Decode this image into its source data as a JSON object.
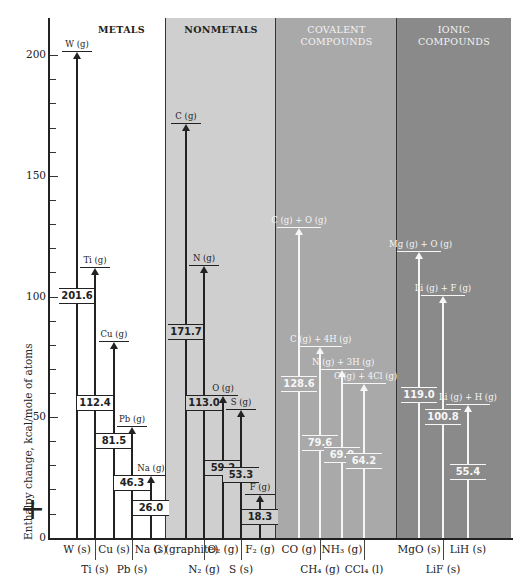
{
  "chart_data": {
    "type": "bar",
    "subtype": "enthalpy-level-diagram",
    "title": "",
    "ylabel": "Enthalpy change, kcal/mole of atoms",
    "ylim": [
      0,
      210
    ],
    "yticks": [
      0,
      50,
      100,
      150,
      200
    ],
    "annotation": "+",
    "groups": [
      {
        "name": "METALS",
        "items": [
          {
            "solid": "W (s)",
            "gas": "W (g)",
            "value": 201.6
          },
          {
            "solid": "Ti (s)",
            "gas": "Ti (g)",
            "value": 112.4
          },
          {
            "solid": "Cu (s)",
            "gas": "Cu (g)",
            "value": 81.5
          },
          {
            "solid": "Pb (s)",
            "gas": "Pb (g)",
            "value": 46.3
          },
          {
            "solid": "Na (s)",
            "gas": "Na (g)",
            "value": 26.0
          }
        ]
      },
      {
        "name": "NONMETALS",
        "items": [
          {
            "solid": "C (graphite)",
            "gas": "C (g)",
            "value": 171.7
          },
          {
            "solid": "N2 (g)",
            "gas": "N (g)",
            "value": 113.0
          },
          {
            "solid": "O2 (g)",
            "gas": "O (g)",
            "value": 59.2
          },
          {
            "solid": "S (s)",
            "gas": "S (g)",
            "value": 53.3
          },
          {
            "solid": "F2 (g)",
            "gas": "F (g)",
            "value": 18.3
          }
        ]
      },
      {
        "name": "COVALENT COMPOUNDS",
        "items": [
          {
            "solid": "CO (g)",
            "gas": "C (g) + O (g)",
            "value": 128.6
          },
          {
            "solid": "CH4 (g)",
            "gas": "C (g) + 4H (g)",
            "value": 79.6
          },
          {
            "solid": "NH3 (g)",
            "gas": "N (g) + 3H (g)",
            "value": 69.9
          },
          {
            "solid": "CCl4 (l)",
            "gas": "C (g) + 4Cl (g)",
            "value": 64.2
          }
        ]
      },
      {
        "name": "IONIC COMPOUNDS",
        "items": [
          {
            "solid": "MgO (s)",
            "gas": "Mg (g) + O (g)",
            "value": 119.0
          },
          {
            "solid": "LiF (s)",
            "gas": "Li (g) + F (g)",
            "value": 100.8
          },
          {
            "solid": "LiH (s)",
            "gas": "Li (g) + H (g)",
            "value": 55.4
          }
        ]
      }
    ],
    "categories": [
      "W (s)",
      "Ti (s)",
      "Cu (s)",
      "Pb (s)",
      "Na (s)",
      "C (graphite)",
      "N2 (g)",
      "O2 (g)",
      "S (s)",
      "F2 (g)",
      "CO (g)",
      "CH4 (g)",
      "NH3 (g)",
      "CCl4 (l)",
      "MgO (s)",
      "LiF (s)",
      "LiH (s)"
    ],
    "values": [
      201.6,
      112.4,
      81.5,
      46.3,
      26.0,
      171.7,
      113.0,
      59.2,
      53.3,
      18.3,
      128.6,
      79.6,
      69.9,
      64.2,
      119.0,
      100.8,
      55.4
    ],
    "grid": false,
    "legend": null
  },
  "panels": {
    "metals": {
      "title": "METALS",
      "color": "#ffffff"
    },
    "nonmetals": {
      "title": "NONMETALS",
      "color": "#cfcfcf"
    },
    "covalent": {
      "title_1": "COVALENT",
      "title_2": "COMPOUNDS",
      "color": "#a9a9a9"
    },
    "ionic": {
      "title_1": "IONIC",
      "title_2": "COMPOUNDS",
      "color": "#8a8a8a"
    }
  },
  "axis": {
    "ylabel": "Enthalpy change, kcal/mole of atoms",
    "ticks": [
      "0",
      "50",
      "100",
      "150",
      "200"
    ],
    "plus": "+"
  },
  "bars": [
    {
      "id": "w",
      "x": 77,
      "val": "201.6",
      "gas": "W (g)",
      "solid": "W (s)",
      "row": 1,
      "dark": true
    },
    {
      "id": "ti",
      "x": 95,
      "val": "112.4",
      "gas": "Ti (g)",
      "solid": "Ti (s)",
      "row": 2,
      "dark": true
    },
    {
      "id": "cu",
      "x": 114,
      "val": "81.5",
      "gas": "Cu (g)",
      "solid": "Cu (s)",
      "row": 1,
      "dark": true
    },
    {
      "id": "pb",
      "x": 132,
      "val": "46.3",
      "gas": "Pb (g)",
      "solid": "Pb (s)",
      "row": 2,
      "dark": true
    },
    {
      "id": "na",
      "x": 151,
      "val": "26.0",
      "gas": "Na (g)",
      "solid": "Na (s)",
      "row": 1,
      "dark": true
    },
    {
      "id": "c",
      "x": 186,
      "val": "171.7",
      "gas": "C (g)",
      "solid": "C (graphite)",
      "row": 1,
      "dark": true
    },
    {
      "id": "n",
      "x": 204,
      "val": "113.0",
      "gas": "N (g)",
      "solid": "N₂ (g)",
      "row": 2,
      "dark": true
    },
    {
      "id": "o",
      "x": 223,
      "val": "59.2",
      "gas": "O (g)",
      "solid": "O₂ (g)",
      "row": 1,
      "dark": true
    },
    {
      "id": "s",
      "x": 241,
      "val": "53.3",
      "gas": "S (g)",
      "solid": "S (s)",
      "row": 2,
      "dark": true
    },
    {
      "id": "f",
      "x": 260,
      "val": "18.3",
      "gas": "F (g)",
      "solid": "F₂ (g)",
      "row": 1,
      "dark": true
    },
    {
      "id": "co",
      "x": 299,
      "val": "128.6",
      "gas": "C (g) + O (g)",
      "solid": "CO (g)",
      "row": 1,
      "dark": false
    },
    {
      "id": "ch4",
      "x": 320,
      "val": "79.6",
      "gas": "C (g) + 4H (g)",
      "solid": "CH₄ (g)",
      "row": 2,
      "dark": false
    },
    {
      "id": "nh3",
      "x": 342,
      "val": "69.9",
      "gas": "N (g) + 3H (g)",
      "solid": "NH₃ (g)",
      "row": 1,
      "dark": false
    },
    {
      "id": "ccl4",
      "x": 364,
      "val": "64.2",
      "gas": "C (g) + 4Cl (g)",
      "solid": "CCl₄ (l)",
      "row": 2,
      "dark": false
    },
    {
      "id": "mgo",
      "x": 419,
      "val": "119.0",
      "gas": "Mg (g) + O (g)",
      "solid": "MgO (s)",
      "row": 1,
      "dark": false
    },
    {
      "id": "lif",
      "x": 443,
      "val": "100.8",
      "gas": "Li (g) + F (g)",
      "solid": "LiF (s)",
      "row": 2,
      "dark": false
    },
    {
      "id": "lih",
      "x": 468,
      "val": "55.4",
      "gas": "Li (g) + H (g)",
      "solid": "LiH (s)",
      "row": 1,
      "dark": false
    }
  ]
}
